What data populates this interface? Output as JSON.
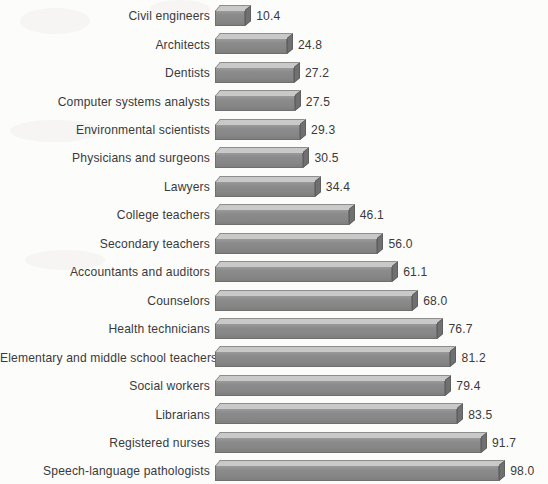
{
  "chart_data": {
    "type": "bar",
    "orientation": "horizontal",
    "title": "",
    "subtitle": "",
    "xlabel": "",
    "ylabel": "",
    "grid": false,
    "legend": null,
    "xlim": [
      0,
      98
    ],
    "value_label_format": "one decimal",
    "categories": [
      "Civil engineers",
      "Architects",
      "Dentists",
      "Computer systems analysts",
      "Environmental scientists",
      "Physicians and surgeons",
      "Lawyers",
      "College teachers",
      "Secondary teachers",
      "Accountants and auditors",
      "Counselors",
      "Health technicians",
      "Elementary and middle school teachers",
      "Social workers",
      "Librarians",
      "Registered nurses",
      "Speech-language pathologists"
    ],
    "values": [
      10.4,
      24.8,
      27.2,
      27.5,
      29.3,
      30.5,
      34.4,
      46.1,
      56.0,
      61.1,
      68.0,
      76.7,
      81.2,
      79.4,
      83.5,
      91.7,
      98.0
    ],
    "value_labels": [
      "10.4",
      "24.8",
      "27.2",
      "27.5",
      "29.3",
      "30.5",
      "34.4",
      "46.1",
      "56.0",
      "61.1",
      "68.0",
      "76.7",
      "81.2",
      "79.4",
      "83.5",
      "91.7",
      "98.0"
    ],
    "colors": {
      "bar_front": "#8a8a8a",
      "bar_top": "#c9c9c9",
      "bar_side": "#707070",
      "bar_outline": "#6f6f6f",
      "background": "#fcfcfb",
      "text": "#3a3a3a"
    }
  }
}
